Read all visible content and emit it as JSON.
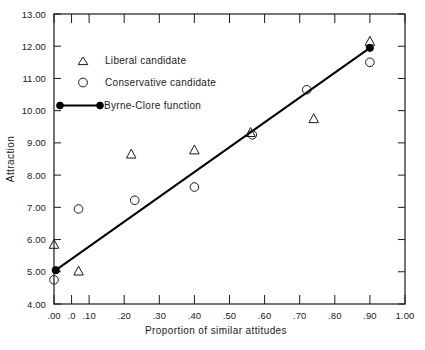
{
  "chart_data": {
    "type": "scatter",
    "title": "",
    "xlabel": "Proportion of similar attitudes",
    "ylabel": "Attraction",
    "xlim": [
      0.0,
      1.0
    ],
    "ylim": [
      4.0,
      13.0
    ],
    "grid": false,
    "legend_position": "top-left-inside",
    "x_ticks": [
      0.0,
      0.05,
      0.1,
      0.2,
      0.3,
      0.4,
      0.5,
      0.6,
      0.7,
      0.8,
      0.9,
      1.0
    ],
    "x_tick_labels": [
      ".00",
      ".0",
      ".10",
      ".20",
      ".30",
      ".40",
      ".50",
      ".60",
      ".70",
      ".80",
      ".90",
      "1.00"
    ],
    "y_ticks": [
      4.0,
      5.0,
      6.0,
      7.0,
      8.0,
      9.0,
      10.0,
      11.0,
      12.0,
      13.0
    ],
    "y_tick_labels": [
      "4.00",
      "5.00",
      "6.00",
      "7.00",
      "8.00",
      "9.00",
      "10.00",
      "11.00",
      "12.00",
      "13.00"
    ],
    "series": [
      {
        "name": "Liberal candidate",
        "marker": "triangle-open",
        "points": [
          {
            "x": 0.0,
            "y": 5.85
          },
          {
            "x": 0.07,
            "y": 5.02
          },
          {
            "x": 0.22,
            "y": 8.65
          },
          {
            "x": 0.4,
            "y": 8.78
          },
          {
            "x": 0.56,
            "y": 9.32
          },
          {
            "x": 0.74,
            "y": 9.75
          },
          {
            "x": 0.9,
            "y": 12.15
          }
        ]
      },
      {
        "name": "Conservative candidate",
        "marker": "circle-open",
        "points": [
          {
            "x": 0.0,
            "y": 4.75
          },
          {
            "x": 0.07,
            "y": 6.95
          },
          {
            "x": 0.23,
            "y": 7.22
          },
          {
            "x": 0.4,
            "y": 7.63
          },
          {
            "x": 0.565,
            "y": 9.25
          },
          {
            "x": 0.72,
            "y": 10.65
          },
          {
            "x": 0.9,
            "y": 11.5
          }
        ]
      },
      {
        "name": "Byrne-Clore function",
        "marker": "line-filled-dot",
        "points": [
          {
            "x": 0.005,
            "y": 5.05
          },
          {
            "x": 0.9,
            "y": 11.95
          }
        ]
      }
    ],
    "legend": [
      {
        "label": "Liberal candidate",
        "marker": "triangle-open"
      },
      {
        "label": "Conservative candidate",
        "marker": "circle-open"
      },
      {
        "label": "Byrne-Clore function",
        "marker": "line-filled-dot"
      }
    ]
  }
}
